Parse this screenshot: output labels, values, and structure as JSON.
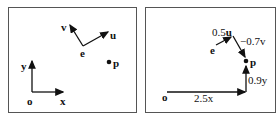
{
  "left_panel": {
    "labels": {
      "o": "o",
      "x": "x",
      "y": "y",
      "e": "e",
      "u": "u",
      "v": "v",
      "p": "p"
    }
  },
  "right_panel": {
    "labels": {
      "o": "o",
      "e": "e",
      "p": "p",
      "x_term": "2.5x",
      "y_term": "0.9y",
      "u_coef": "0.5",
      "u": "u",
      "v_term": "−0.7v"
    }
  },
  "colors": {
    "ink": "#111111",
    "frame": "#555555",
    "background": "#ffffff"
  }
}
